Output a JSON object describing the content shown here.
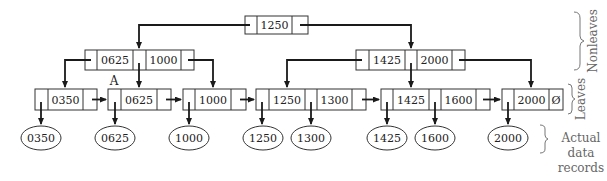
{
  "diagram": {
    "type": "B+ tree",
    "root": {
      "keys": [
        "1250"
      ]
    },
    "nonleaves": [
      {
        "id": "left",
        "keys": [
          "0625",
          "1000"
        ]
      },
      {
        "id": "right",
        "keys": [
          "1425",
          "2000"
        ]
      }
    ],
    "leaves": [
      {
        "keys": [
          "0350"
        ]
      },
      {
        "keys": [
          "0625"
        ],
        "label": "A"
      },
      {
        "keys": [
          "1000"
        ]
      },
      {
        "keys": [
          "1250",
          "1300"
        ]
      },
      {
        "keys": [
          "1425",
          "1600"
        ]
      },
      {
        "keys": [
          "2000"
        ],
        "null_pointer": "Ø"
      }
    ],
    "records": [
      "0350",
      "0625",
      "1000",
      "1250",
      "1300",
      "1425",
      "1600",
      "2000"
    ],
    "labels": {
      "nonleaves": "Nonleaves",
      "leaves": "Leaves",
      "records_line1": "Actual",
      "records_line2": "data",
      "records_line3": "records",
      "node_a": "A"
    }
  }
}
